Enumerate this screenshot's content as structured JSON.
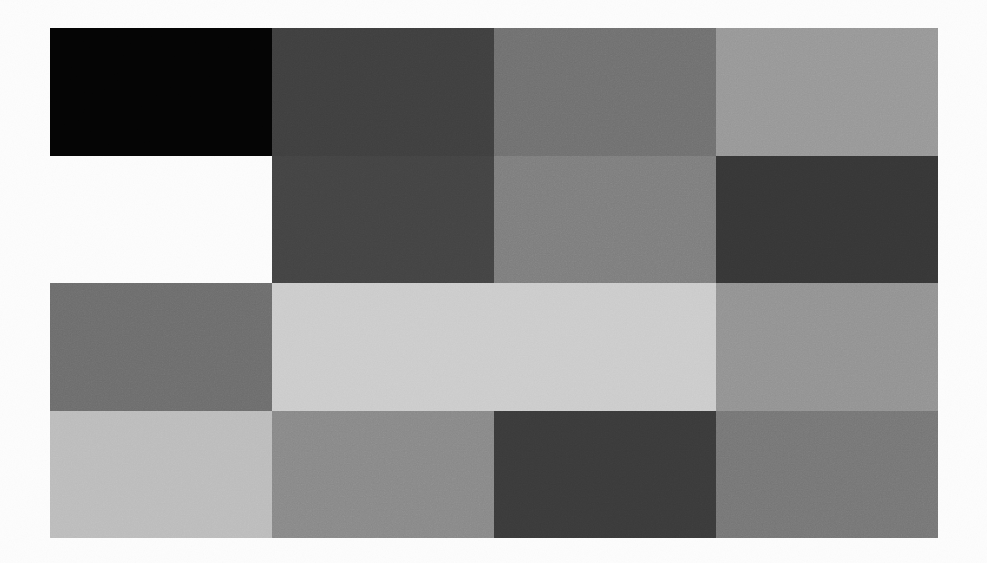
{
  "figure": {
    "title": "",
    "background_color": "#ffffff",
    "width": 987,
    "height": 563
  },
  "chart_data": {
    "type": "heatmap",
    "title": "",
    "xlabel": "",
    "ylabel": "",
    "grid": false,
    "legend_position": "none",
    "colorscale": "grayscale",
    "value_range": [
      0,
      255
    ],
    "note": "Each cell is a flat grayscale patch; value = 8-bit gray level. Null cells are blank (paper white).",
    "columns": [
      "1",
      "2",
      "3",
      "4"
    ],
    "rows": [
      "1",
      "2",
      "3",
      "4"
    ],
    "cells": [
      [
        {
          "row": 0,
          "col": 0,
          "value": 4,
          "color": "#040404",
          "empty": false
        },
        {
          "row": 0,
          "col": 1,
          "value": 63,
          "color": "#3f3f3f",
          "empty": false
        },
        {
          "row": 0,
          "col": 2,
          "value": 112,
          "color": "#707070",
          "empty": false
        },
        {
          "row": 0,
          "col": 3,
          "value": 152,
          "color": "#989898",
          "empty": false
        }
      ],
      [
        {
          "row": 1,
          "col": 0,
          "value": null,
          "color": "#ffffff",
          "empty": true
        },
        {
          "row": 1,
          "col": 1,
          "value": 67,
          "color": "#434343",
          "empty": false
        },
        {
          "row": 1,
          "col": 2,
          "value": 126,
          "color": "#7e7e7e",
          "empty": false
        },
        {
          "row": 1,
          "col": 3,
          "value": 54,
          "color": "#363636",
          "empty": false
        }
      ],
      [
        {
          "row": 2,
          "col": 0,
          "value": 109,
          "color": "#6d6d6d",
          "empty": false
        },
        {
          "row": 2,
          "col": 1,
          "value": 205,
          "color": "#cdcdcd",
          "empty": false
        },
        {
          "row": 2,
          "col": 2,
          "value": 205,
          "color": "#cdcdcd",
          "empty": false
        },
        {
          "row": 2,
          "col": 3,
          "value": 147,
          "color": "#939393",
          "empty": false
        }
      ],
      [
        {
          "row": 3,
          "col": 0,
          "value": 189,
          "color": "#bdbdbd",
          "empty": false
        },
        {
          "row": 3,
          "col": 1,
          "value": 137,
          "color": "#898989",
          "empty": false
        },
        {
          "row": 3,
          "col": 2,
          "value": 58,
          "color": "#3a3a3a",
          "empty": false
        },
        {
          "row": 3,
          "col": 3,
          "value": 118,
          "color": "#767676",
          "empty": false
        }
      ]
    ],
    "plot_box": {
      "left": 50,
      "top": 28,
      "width": 888,
      "height": 510
    }
  }
}
